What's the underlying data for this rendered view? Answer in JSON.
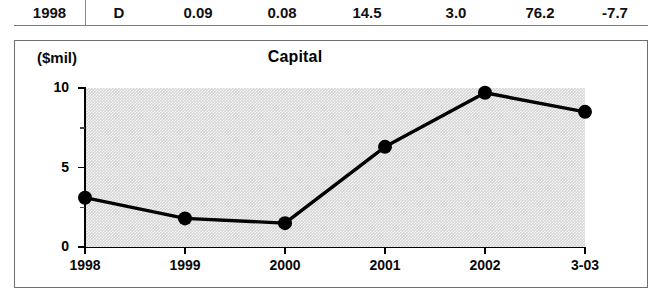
{
  "table": {
    "columns": [
      "year",
      "grade",
      "value1",
      "value2",
      "value3",
      "value4",
      "value5",
      "value6"
    ],
    "row": {
      "year": "1998",
      "grade": "D",
      "value1": "0.09",
      "value2": "0.08",
      "value3": "14.5",
      "value4": "3.0",
      "value5": "76.2",
      "value6": "-7.7"
    }
  },
  "chart_data": {
    "type": "line",
    "title": "Capital",
    "xlabel": "",
    "ylabel": "($mil)",
    "categories": [
      "1998",
      "1999",
      "2000",
      "2001",
      "2002",
      "3-03"
    ],
    "values": [
      3.1,
      1.8,
      1.5,
      6.3,
      9.7,
      8.5
    ],
    "ylim": [
      0,
      10
    ],
    "yticks": [
      0,
      5,
      10
    ],
    "ytick_labels": [
      "0",
      "5",
      "10"
    ],
    "yminor_ticks": [
      2.5,
      7.5
    ],
    "grid": false,
    "legend": false,
    "marker": "filled-circle",
    "line_color": "#000000",
    "plot_background": "#d4d4d4"
  }
}
